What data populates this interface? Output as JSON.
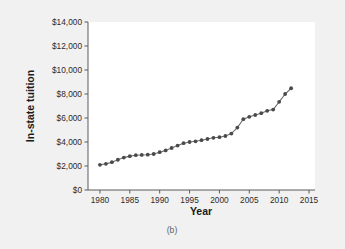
{
  "figure": {
    "caption": "(b)",
    "background_color": "#f1f1f1",
    "plot_background_color": "#ffffff"
  },
  "chart_data": {
    "type": "line",
    "title": "",
    "xlabel": "Year",
    "ylabel": "In-state tuition",
    "xlim": [
      1978,
      2016
    ],
    "ylim": [
      0,
      14000
    ],
    "xticks": [
      1980,
      1985,
      1990,
      1995,
      2000,
      2005,
      2010,
      2015
    ],
    "xticklabels": [
      "1980",
      "1985",
      "1990",
      "1995",
      "2000",
      "2005",
      "2010",
      "2015"
    ],
    "yticks": [
      0,
      2000,
      4000,
      6000,
      8000,
      10000,
      12000,
      14000
    ],
    "yticklabels": [
      "$0",
      "$2,000",
      "$4,000",
      "$6,000",
      "$8,000",
      "$10,000",
      "$12,000",
      "$14,000"
    ],
    "grid": false,
    "legend": null,
    "marker": "circle",
    "marker_color": "#4a4a4a",
    "line_color": "#6e6e6e",
    "x": [
      1980,
      1981,
      1982,
      1983,
      1984,
      1985,
      1986,
      1987,
      1988,
      1989,
      1990,
      1991,
      1992,
      1993,
      1994,
      1995,
      1996,
      1997,
      1998,
      1999,
      2000,
      2001,
      2002,
      2003,
      2004,
      2005,
      2006,
      2007,
      2008,
      2009,
      2010,
      2011,
      2012
    ],
    "values": [
      2100,
      2180,
      2320,
      2520,
      2700,
      2820,
      2900,
      2920,
      2940,
      3000,
      3150,
      3300,
      3500,
      3700,
      3900,
      4000,
      4060,
      4150,
      4250,
      4350,
      4400,
      4500,
      4700,
      5200,
      5900,
      6100,
      6250,
      6400,
      6600,
      6700,
      7350,
      8000,
      8480
    ]
  }
}
